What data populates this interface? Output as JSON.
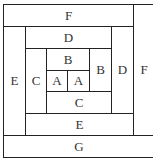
{
  "diagram": {
    "type": "log-cabin quilt block",
    "pieces": [
      {
        "id": "F_top",
        "label": "F",
        "x": 3,
        "y": 4,
        "w": 131,
        "h": 23
      },
      {
        "id": "F_right",
        "label": "F",
        "x": 133,
        "y": 4,
        "w": 22,
        "h": 132
      },
      {
        "id": "E_left",
        "label": "E",
        "x": 3,
        "y": 26,
        "w": 23,
        "h": 110
      },
      {
        "id": "D_top",
        "label": "D",
        "x": 25,
        "y": 26,
        "w": 87,
        "h": 23
      },
      {
        "id": "D_right",
        "label": "D",
        "x": 111,
        "y": 26,
        "w": 23,
        "h": 88
      },
      {
        "id": "C_left",
        "label": "C",
        "x": 25,
        "y": 48,
        "w": 22,
        "h": 66
      },
      {
        "id": "B_top",
        "label": "B",
        "x": 46,
        "y": 48,
        "w": 44,
        "h": 23
      },
      {
        "id": "B_right",
        "label": "B",
        "x": 89,
        "y": 48,
        "w": 23,
        "h": 44
      },
      {
        "id": "A_left",
        "label": "A",
        "x": 46,
        "y": 70,
        "w": 22,
        "h": 22
      },
      {
        "id": "A_right",
        "label": "A",
        "x": 67,
        "y": 70,
        "w": 23,
        "h": 22
      },
      {
        "id": "C_bottom",
        "label": "C",
        "x": 46,
        "y": 91,
        "w": 66,
        "h": 23
      },
      {
        "id": "E_bottom",
        "label": "E",
        "x": 25,
        "y": 113,
        "w": 109,
        "h": 23
      },
      {
        "id": "G_bottom",
        "label": "G",
        "x": 3,
        "y": 135,
        "w": 152,
        "h": 23
      }
    ]
  }
}
